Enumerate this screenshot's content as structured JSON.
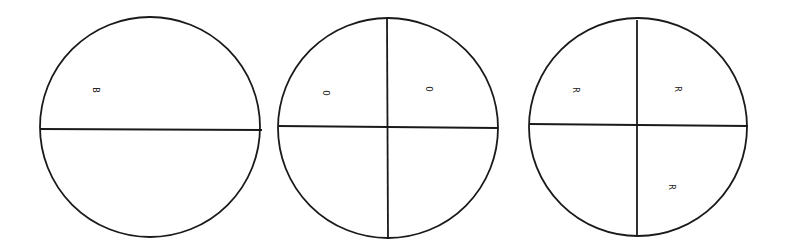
{
  "diagram": {
    "stroke_color": "#1a1a1a",
    "background": "#ffffff",
    "circles": [
      {
        "id": "circle-halves",
        "divisions": "halves",
        "center": [
          150,
          127
        ],
        "radius": 110,
        "labels": [
          {
            "text": "B",
            "x": 95,
            "y": 90,
            "rotation": 90
          }
        ]
      },
      {
        "id": "circle-quarters-o",
        "divisions": "quarters",
        "center": [
          388,
          128
        ],
        "radius": 110,
        "labels": [
          {
            "text": "O",
            "x": 325,
            "y": 93,
            "rotation": 90
          },
          {
            "text": "O",
            "x": 428,
            "y": 89,
            "rotation": 90
          }
        ]
      },
      {
        "id": "circle-quarters-r",
        "divisions": "quarters",
        "center": [
          638,
          127
        ],
        "radius": 109,
        "labels": [
          {
            "text": "R",
            "x": 575,
            "y": 90,
            "rotation": 90
          },
          {
            "text": "R",
            "x": 677,
            "y": 89,
            "rotation": 90
          },
          {
            "text": "R",
            "x": 671,
            "y": 187,
            "rotation": 90
          }
        ]
      }
    ]
  }
}
